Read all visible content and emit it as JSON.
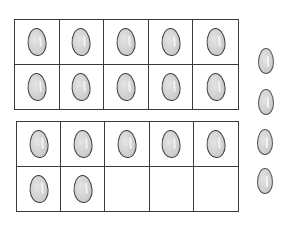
{
  "illustration": {
    "description": "Two ten-frames with counters plus loose counters",
    "frames": [
      {
        "name": "top-ten-frame",
        "filled": [
          true,
          true,
          true,
          true,
          true,
          true,
          true,
          true,
          true,
          true
        ]
      },
      {
        "name": "bottom-ten-frame",
        "filled": [
          true,
          true,
          true,
          true,
          true,
          true,
          true,
          false,
          false,
          false
        ]
      }
    ],
    "loose_counters": 4,
    "counter_color": "#cfcfcf",
    "line_color": "#3a3a3a"
  }
}
